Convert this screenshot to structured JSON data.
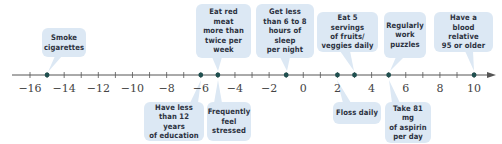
{
  "colors": {
    "box_fill": "#dce8f4",
    "axis": "#555555",
    "point": "#1f4f4f",
    "text": "#2b3140"
  },
  "axis": {
    "min": -16,
    "max": 10,
    "tick_step": 1,
    "label_step": 2,
    "labels": [
      "−16",
      "−14",
      "−12",
      "−10",
      "−8",
      "−6",
      "−4",
      "−2",
      "0",
      "2",
      "4",
      "6",
      "8",
      "10"
    ],
    "arrow": "right"
  },
  "factors_above": [
    {
      "text": "Smoke\ncigarettes",
      "value": -15
    },
    {
      "text": "Eat red meat\nmore than\ntwice per\nweek",
      "value": -5
    },
    {
      "text": "Get less\nthan 6 to 8\nhours of sleep\nper night",
      "value": -1
    },
    {
      "text": "Eat 5 servings\nof fruits/\nveggies daily",
      "value": 3
    },
    {
      "text": "Regularly\nwork\npuzzles",
      "value": 5
    },
    {
      "text": "Have a\nblood relative\n95 or older",
      "value": 10
    }
  ],
  "factors_below": [
    {
      "text": "Have less\nthan 12 years\nof education",
      "value": -6
    },
    {
      "text": "Frequently\nfeel\nstressed",
      "value": -5
    },
    {
      "text": "Floss daily",
      "value": 2
    },
    {
      "text": "Take 81 mg\nof aspirin\nper day",
      "value": 5
    }
  ],
  "points": [
    -15,
    -6,
    -5,
    -1,
    2,
    3,
    5,
    10
  ]
}
